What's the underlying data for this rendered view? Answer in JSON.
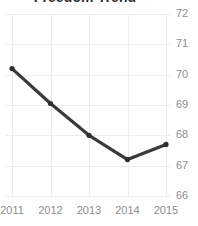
{
  "chart_data": {
    "type": "line",
    "title": "Freedom Trend",
    "xlabel": "",
    "ylabel": "",
    "categories": [
      "2011",
      "2012",
      "2013",
      "2014",
      "2015"
    ],
    "values": [
      70.2,
      69.05,
      68.0,
      67.2,
      67.7
    ],
    "series": [
      {
        "name": "Freedom Trend",
        "values": [
          70.2,
          69.05,
          68.0,
          67.2,
          67.7
        ]
      }
    ],
    "x_tick_labels": [
      "2011",
      "2012",
      "2013",
      "2014",
      "2015"
    ],
    "y_tick_labels": [
      "72",
      "71",
      "70",
      "69",
      "68",
      "67",
      "66"
    ],
    "y_ticks": [
      72,
      71,
      70,
      69,
      68,
      67,
      66
    ],
    "ylim": [
      66,
      72
    ],
    "grid": true,
    "legend": false,
    "legend_position": "none",
    "y_axis_side": "right",
    "markers": true,
    "colors": {
      "line": "#3a3a3a",
      "marker": "#2f2f2f",
      "grid": "#ededed",
      "tick_label": "#8d8d8d",
      "title": "#2f2f2f",
      "background": "#ffffff"
    }
  }
}
